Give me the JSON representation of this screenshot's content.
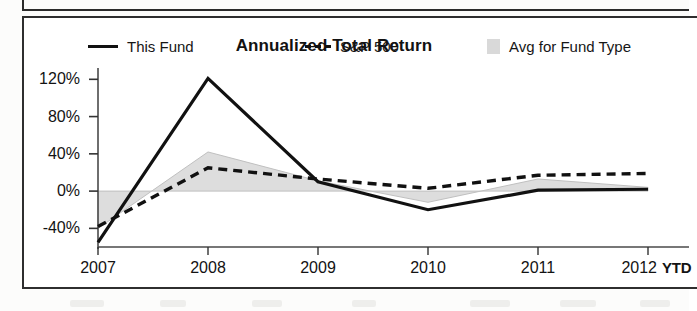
{
  "chart_panel": {
    "title": "Annualized Total Return"
  },
  "legend": {
    "items": [
      {
        "label": "This Fund",
        "marker": "solid-line",
        "color": "#111111"
      },
      {
        "label": "S&P 500",
        "marker": "dashed-line",
        "color": "#111111"
      },
      {
        "label": "Avg for Fund Type",
        "marker": "filled-area",
        "color": "#d9d9d9"
      }
    ]
  },
  "axis": {
    "y_ticks": [
      "120%",
      "80%",
      "40%",
      "0%",
      "-40%"
    ],
    "x_ticks": [
      "2007",
      "2008",
      "2009",
      "2010",
      "2011",
      "2012"
    ],
    "x_suffix": "YTD"
  },
  "chart_data": {
    "type": "line",
    "title": "Annualized Total Return",
    "xlabel": "",
    "ylabel": "",
    "categories": [
      "2007",
      "2008",
      "2009",
      "2010",
      "2011",
      "2012 YTD"
    ],
    "ylim": [
      -60,
      130
    ],
    "yticks": [
      -40,
      0,
      40,
      80,
      120
    ],
    "grid": false,
    "legend_position": "top",
    "series": [
      {
        "name": "This Fund",
        "style": "solid",
        "color": "#111111",
        "values": [
          -55,
          121,
          10,
          -20,
          1,
          2
        ]
      },
      {
        "name": "S&P 500",
        "style": "dashed",
        "color": "#111111",
        "values": [
          -38,
          25,
          13,
          3,
          17,
          19
        ]
      },
      {
        "name": "Avg for Fund Type",
        "style": "filled-area",
        "color": "#d9d9d9",
        "values": [
          -40,
          42,
          11,
          -12,
          13,
          4
        ]
      }
    ]
  }
}
